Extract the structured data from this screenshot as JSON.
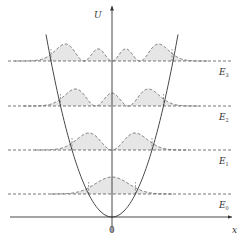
{
  "figure": {
    "axes": {
      "y_label": "U",
      "x_label": "x",
      "origin_label": "0"
    },
    "levels": [
      {
        "name": "E",
        "sub": "0",
        "y": 194,
        "nodes": 0,
        "left": 88.6,
        "right": 135.4
      },
      {
        "name": "E",
        "sub": "1",
        "y": 150,
        "nodes": 1,
        "left": 72,
        "right": 152
      },
      {
        "name": "E",
        "sub": "2",
        "y": 106,
        "nodes": 2,
        "left": 60.5,
        "right": 163.5
      },
      {
        "name": "E",
        "sub": "3",
        "y": 61,
        "nodes": 3,
        "left": 51,
        "right": 172
      }
    ],
    "potential": "parabola U ∝ x²",
    "colors": {
      "line": "#333333",
      "dashed": "#555555",
      "fill": "#e6e6e6"
    }
  }
}
